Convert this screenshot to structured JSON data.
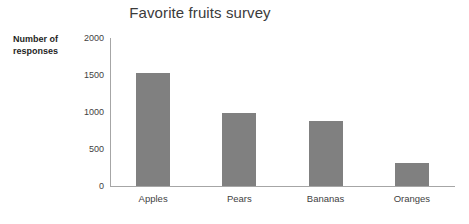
{
  "chart_data": {
    "type": "bar",
    "title": "Favorite fruits survey",
    "xlabel": "",
    "ylabel": "Number of responses",
    "ylabel_lines": [
      "Number of",
      "responses"
    ],
    "categories": [
      "Apples",
      "Pears",
      "Bananas",
      "Oranges"
    ],
    "values": [
      1525,
      990,
      880,
      310
    ],
    "ylim": [
      0,
      2000
    ],
    "yticks": [
      0,
      500,
      1000,
      1500,
      2000
    ],
    "ytick_labels": [
      "0",
      "500",
      "1000",
      "1500",
      "2000"
    ],
    "grid": false,
    "legend": false,
    "legend_position": "none",
    "series": [
      {
        "name": "Number of responses",
        "values": [
          1525,
          990,
          880,
          310
        ]
      }
    ],
    "colors": {
      "bar": "#808080",
      "axis": "#a6a6a6",
      "title_text": "#3b3b3b",
      "tick_text": "#3f3f3f",
      "axis_title_text": "#1f1f1f",
      "background": "#ffffff"
    }
  }
}
